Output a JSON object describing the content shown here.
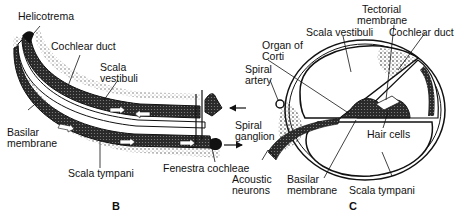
{
  "figure": {
    "panels": [
      {
        "id": "B",
        "caption": "B",
        "title": "Uncoiled cochlea (longitudinal view)",
        "labels": {
          "helicotrema": "Helicotrema",
          "cochlear_duct": "Cochlear duct",
          "scala_vestibuli_1": "Scala",
          "scala_vestibuli_2": "vestibuli",
          "basilar_membrane_1": "Basilar",
          "basilar_membrane_2": "membrane",
          "scala_tympani": "Scala tympani",
          "fenestra_cochleae": "Fenestra cochleae",
          "spiral_ganglion_1": "Spiral",
          "spiral_ganglion_2": "ganglion"
        }
      },
      {
        "id": "C",
        "caption": "C",
        "title": "Cross section of cochlea",
        "labels": {
          "tectorial_membrane_1": "Tectorial",
          "tectorial_membrane_2": "membrane",
          "scala_vestibuli": "Scala vestibuli",
          "cochlear_duct": "Cochlear duct",
          "organ_of_corti_1": "Organ of",
          "organ_of_corti_2": "Corti",
          "spiral_artery_1": "Spiral",
          "spiral_artery_2": "artery",
          "hair_cells": "Hair cells",
          "acoustic_neurons_1": "Acoustic",
          "acoustic_neurons_2": "neurons",
          "basilar_membrane_1": "Basilar",
          "basilar_membrane_2": "membrane",
          "scala_tympani": "Scala tympani"
        }
      }
    ],
    "colors": {
      "ink": "#111111",
      "background": "#ffffff",
      "stipple": "#333333"
    }
  }
}
